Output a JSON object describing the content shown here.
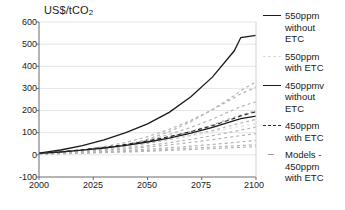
{
  "chart": {
    "type": "line",
    "y_axis_title": "US$/tCO",
    "y_axis_title_sub": "2",
    "xlabel": "",
    "ylabel": "US$/tCO2",
    "title": "",
    "xlim": [
      2000,
      2100
    ],
    "ylim": [
      -100,
      600
    ],
    "xticks": [
      "2000",
      "2025",
      "2050",
      "2075",
      "2100"
    ],
    "yticks": [
      "600",
      "500",
      "400",
      "300",
      "200",
      "100",
      "0",
      "-100"
    ],
    "grid": "horizontal"
  },
  "legend": {
    "position": "right",
    "items": [
      {
        "label": "550ppm without ETC",
        "style": "solid-black",
        "marker": "m-solid",
        "lines": [
          "550ppm",
          "without",
          "ETC"
        ]
      },
      {
        "label": "550ppm with ETC",
        "style": "faint-dashed-grey",
        "marker": "m-faint",
        "lines": [
          "550ppm",
          "with ETC"
        ]
      },
      {
        "label": "450ppmv without ETC",
        "style": "solid-black",
        "marker": "m-solid",
        "lines": [
          "450ppmv",
          "without",
          "ETC"
        ]
      },
      {
        "label": "450ppm with ETC",
        "style": "dashed-black",
        "marker": "m-dashed",
        "lines": [
          "450ppm",
          "with ETC"
        ]
      },
      {
        "label": "Models - 450ppm with ETC",
        "style": "grey-dash-marker",
        "marker": "m-models",
        "lines": [
          "Models -",
          "450ppm",
          "with ETC"
        ]
      }
    ]
  },
  "chart_data": {
    "type": "line",
    "title": "",
    "xlabel": "",
    "ylabel": "US$/tCO2",
    "xlim": [
      2000,
      2100
    ],
    "ylim": [
      -100,
      600
    ],
    "xticks": [
      2000,
      2025,
      2050,
      2075,
      2100
    ],
    "yticks": [
      -100,
      0,
      100,
      200,
      300,
      400,
      500,
      600
    ],
    "grid": true,
    "legend_position": "right",
    "x": [
      2000,
      2010,
      2020,
      2030,
      2040,
      2050,
      2060,
      2070,
      2080,
      2090,
      2093,
      2100
    ],
    "series": [
      {
        "name": "550ppm without ETC",
        "style": "solid",
        "color": "#1a1a1a",
        "values": [
          8,
          22,
          42,
          68,
          100,
          140,
          192,
          262,
          352,
          470,
          530,
          540
        ]
      },
      {
        "name": "550ppm with ETC",
        "style": "faint-dashed",
        "color": "#e0e0e0",
        "values": [
          6,
          13,
          22,
          32,
          43,
          56,
          70,
          86,
          104,
          124,
          130,
          140
        ]
      },
      {
        "name": "450ppmv without ETC",
        "style": "solid",
        "color": "#1a1a1a",
        "values": [
          7,
          13,
          21,
          31,
          43,
          58,
          76,
          98,
          124,
          155,
          164,
          175
        ]
      },
      {
        "name": "450ppm with ETC",
        "style": "dashed",
        "color": "#2b2b2b",
        "values": [
          7,
          14,
          23,
          34,
          47,
          63,
          82,
          105,
          132,
          165,
          176,
          195
        ]
      }
    ],
    "model_runs": {
      "name": "Models - 450ppm with ETC",
      "style": "grey-dashed",
      "color": "#b4b4b4",
      "note": "Ensemble of individual model trajectories, 450ppm with ETC",
      "runs": [
        {
          "values": [
            5,
            10,
            17,
            28,
            45,
            70,
            105,
            150,
            205,
            268,
            290,
            330
          ]
        },
        {
          "values": [
            5,
            11,
            19,
            30,
            46,
            66,
            92,
            124,
            162,
            205,
            218,
            240
          ]
        },
        {
          "values": [
            6,
            12,
            20,
            30,
            43,
            60,
            81,
            106,
            136,
            170,
            180,
            200
          ]
        },
        {
          "values": [
            6,
            11,
            18,
            27,
            38,
            52,
            68,
            88,
            110,
            136,
            144,
            160
          ]
        },
        {
          "values": [
            5,
            9,
            15,
            22,
            31,
            42,
            55,
            70,
            87,
            106,
            112,
            125
          ]
        },
        {
          "values": [
            5,
            9,
            14,
            20,
            27,
            35,
            45,
            56,
            69,
            83,
            87,
            96
          ]
        },
        {
          "values": [
            4,
            7,
            11,
            15,
            20,
            26,
            32,
            39,
            47,
            56,
            59,
            65
          ]
        },
        {
          "values": [
            4,
            6,
            9,
            12,
            16,
            20,
            25,
            30,
            35,
            41,
            42,
            45
          ]
        },
        {
          "values": [
            3,
            5,
            7,
            10,
            13,
            16,
            20,
            24,
            28,
            33,
            34,
            37
          ]
        },
        {
          "values": [
            6,
            13,
            23,
            37,
            56,
            82,
            115,
            156,
            204,
            258,
            276,
            305
          ]
        }
      ]
    }
  }
}
